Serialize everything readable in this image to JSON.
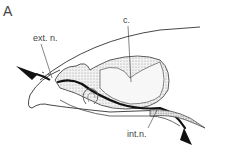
{
  "figure": {
    "panel_label": "A",
    "labels": {
      "ext_n": "ext. n.",
      "c": "c.",
      "int_n": "int.n."
    }
  }
}
